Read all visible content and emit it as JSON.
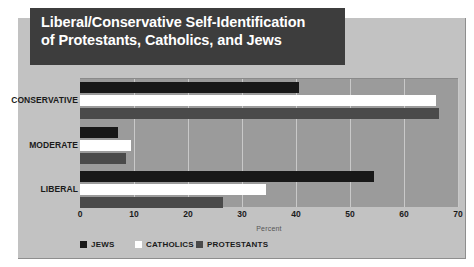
{
  "title": {
    "line1": "Liberal/Conservative Self-Identification",
    "line2": "of Protestants, Catholics, and Jews"
  },
  "colors": {
    "jews": "#181818",
    "catholics": "#ffffff",
    "protestants": "#4a4a4a",
    "plot_background": "#9b9b9b",
    "card_background": "#c2c2c2",
    "title_banner": "#3d3d3d",
    "gridline": "#c9c9c9"
  },
  "chart_data": {
    "type": "bar",
    "orientation": "horizontal",
    "title": "Liberal/Conservative Self-Identification of Protestants, Catholics, and Jews",
    "categories": [
      "CONSERVATIVE",
      "MODERATE",
      "LIBERAL"
    ],
    "series": [
      {
        "name": "JEWS",
        "values": [
          40.5,
          7,
          54.5
        ]
      },
      {
        "name": "CATHOLICS",
        "values": [
          66,
          9.5,
          34.5
        ]
      },
      {
        "name": "PROTESTANTS",
        "values": [
          66.5,
          8.5,
          26.5
        ]
      }
    ],
    "xlabel": "Percent",
    "ylabel": "",
    "xlim": [
      0,
      70
    ],
    "xticks": [
      0,
      10,
      20,
      30,
      40,
      50,
      60,
      70
    ],
    "xtick_labels": [
      "0",
      "10",
      "20",
      "30",
      "40",
      "50",
      "60",
      "70"
    ],
    "grid": "vertical",
    "legend_position": "bottom",
    "legend_entries": [
      "JEWS",
      "CATHOLICS",
      "PROTESTANTS"
    ]
  }
}
